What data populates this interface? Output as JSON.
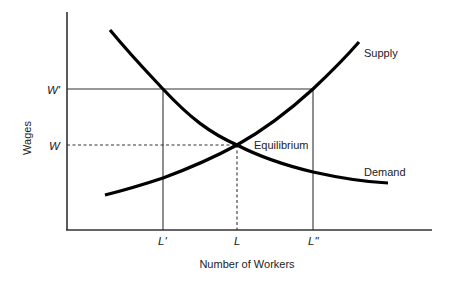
{
  "diagram": {
    "axes": {
      "y_label": "Wages",
      "x_label": "Number of Workers",
      "y_ticks": [
        {
          "label": "W'",
          "y": 89
        },
        {
          "label": "W",
          "y": 145
        }
      ],
      "x_ticks": [
        {
          "label": "L'",
          "x": 163
        },
        {
          "label": "L",
          "x": 237
        },
        {
          "label": "L\"",
          "x": 313
        }
      ]
    },
    "curves": {
      "supply": {
        "label": "Supply"
      },
      "demand": {
        "label": "Demand"
      }
    },
    "annotations": {
      "equilibrium": "Equilibrium"
    },
    "colors": {
      "curve": "#000000",
      "axis": "#333333",
      "guide": "#333333",
      "text": "#222222"
    }
  }
}
